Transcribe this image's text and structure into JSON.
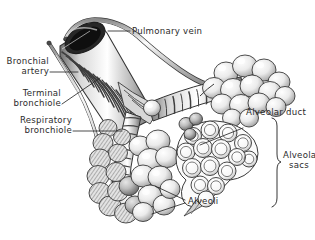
{
  "figure": {
    "style": "grayscale pen-and-ink anatomical illustration",
    "background_color": "#ffffff",
    "ink_color": "#2b2b2b",
    "shading_light": "#f2f2f2",
    "shading_mid": "#b9b9b9",
    "shading_dark": "#545454"
  },
  "labels": {
    "pulmonary_vein": "Pulmonary vein",
    "bronchial_artery_line1": "Bronchial",
    "bronchial_artery_line2": "artery",
    "terminal_bronchiole_line1": "Terminal",
    "terminal_bronchiole_line2": "bronchiole",
    "respiratory_bronchiole_line1": "Respiratory",
    "respiratory_bronchiole_line2": "bronchiole",
    "alveolar_duct": "Alveolar duct",
    "alveolar_sacs_line1": "Alveolar",
    "alveolar_sacs_line2": "sacs",
    "alveoli": "Alveoli"
  },
  "structures": [
    {
      "name": "pulmonary-vein",
      "description": "thin curved vessel arcing from upper left down to the right"
    },
    {
      "name": "bronchial-artery",
      "description": "slender vessel running down the left side of the airway"
    },
    {
      "name": "terminal-bronchiole",
      "description": "large striated airway tube with open elliptical lumen at top"
    },
    {
      "name": "respiratory-bronchiole",
      "description": "ringed airway branching down-left and right"
    },
    {
      "name": "alveolar-duct",
      "description": "ringed duct leading to alveolar sacs on the right"
    },
    {
      "name": "alveolar-sacs",
      "description": "cut-away clustered sacs at lower right"
    },
    {
      "name": "alveoli-cluster-left",
      "description": "dense hatched grape-like cluster at lower left"
    },
    {
      "name": "alveoli-cluster-upper-right",
      "description": "smooth rounded cluster at upper right"
    }
  ]
}
